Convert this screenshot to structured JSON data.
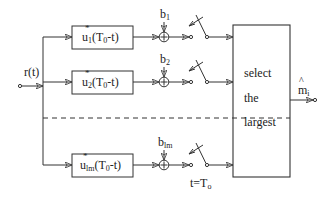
{
  "diagram": {
    "input": {
      "label": "r(t)"
    },
    "branches": [
      {
        "filter": {
          "base": "u",
          "sub": "1",
          "arg": "(T",
          "arg_sub": "0",
          "arg_end": "-t)"
        },
        "bias": {
          "base": "b",
          "sub": "1"
        }
      },
      {
        "filter": {
          "base": "u",
          "sub": "2",
          "arg": "(T",
          "arg_sub": "0",
          "arg_end": "-t)"
        },
        "bias": {
          "base": "b",
          "sub": "2"
        }
      },
      {
        "filter": {
          "base": "u",
          "sub": "lm",
          "arg": "(T",
          "arg_sub": "0",
          "arg_end": "-t)"
        },
        "bias": {
          "base": "b",
          "sub": "lm"
        }
      }
    ],
    "summer_symbol": "+",
    "sampler": {
      "label": "t=T",
      "label_sub": "o"
    },
    "decision": {
      "lines": [
        "select",
        "the",
        "largest"
      ]
    },
    "output": {
      "base": "m",
      "sub": "i",
      "hat": "^"
    },
    "colors": {
      "line": "#333333",
      "text": "#222222",
      "background": "#ffffff"
    }
  }
}
